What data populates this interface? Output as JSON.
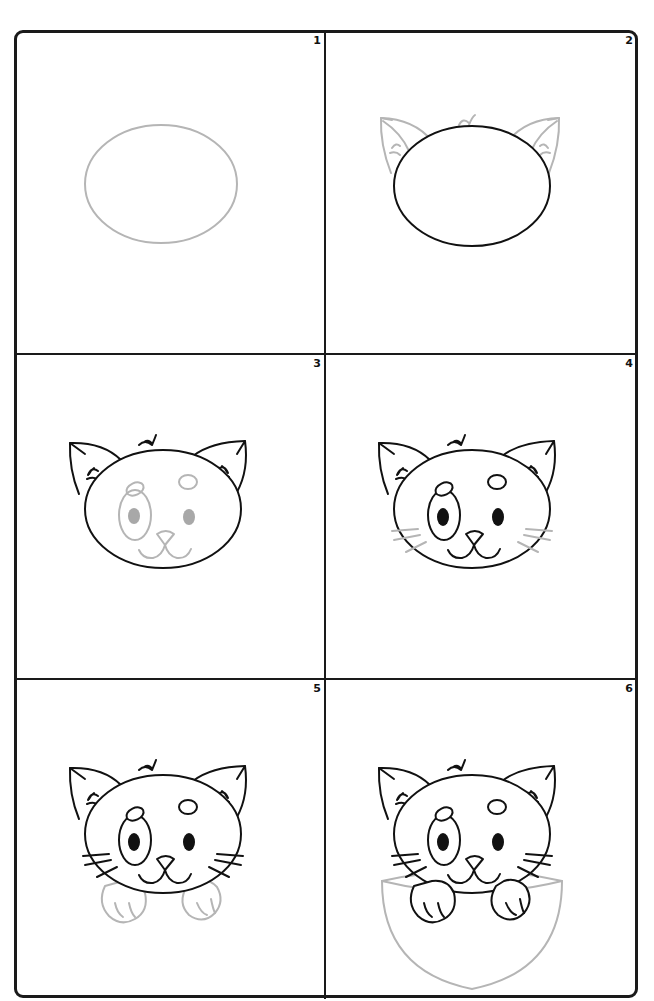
{
  "colors": {
    "frame": "#1a1a1a",
    "ink": "#111111",
    "guide_line": "#b5b5b5",
    "guide_fill": "#a8a8a8",
    "background": "#ffffff"
  },
  "panels": [
    {
      "number": "1",
      "step": "Draw an oval for the head (guide line)"
    },
    {
      "number": "2",
      "step": "Ink the head; sketch pointed ears with fur tufts"
    },
    {
      "number": "3",
      "step": "Ink ears and tufts; sketch eye, pupils, spots, nose and mouth"
    },
    {
      "number": "4",
      "step": "Ink facial features; sketch whiskers"
    },
    {
      "number": "5",
      "step": "Ink whiskers; sketch paws"
    },
    {
      "number": "6",
      "step": "Ink paws; sketch the pocket"
    }
  ]
}
